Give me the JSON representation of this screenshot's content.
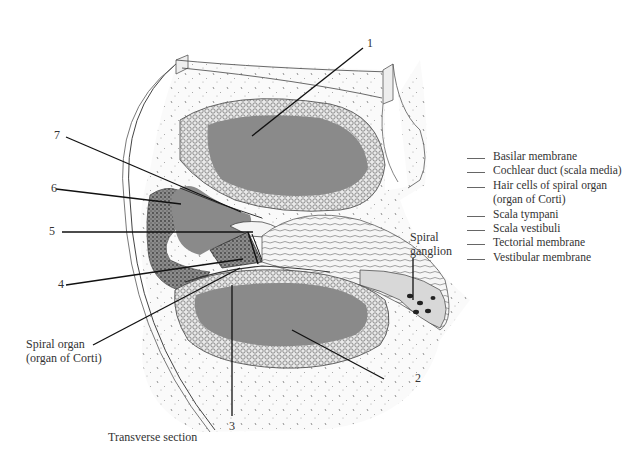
{
  "figure": {
    "caption": "Transverse section",
    "colors": {
      "fluid_gray": "#8a8a8a",
      "bone_stipple": "#f3f3f3",
      "tissue_dark": "#6a6a6a",
      "line": "#111111"
    },
    "numbered_labels": [
      {
        "id": "1",
        "text": "1"
      },
      {
        "id": "2",
        "text": "2"
      },
      {
        "id": "3",
        "text": "3"
      },
      {
        "id": "4",
        "text": "4"
      },
      {
        "id": "5",
        "text": "5"
      },
      {
        "id": "6",
        "text": "6"
      },
      {
        "id": "7",
        "text": "7"
      }
    ],
    "named_labels": {
      "spiral_organ_line1": "Spiral organ",
      "spiral_organ_line2": "(organ of Corti)",
      "spiral_ganglion_line1": "Spiral",
      "spiral_ganglion_line2": "ganglion"
    }
  },
  "legend": {
    "items": [
      {
        "text": "Basilar membrane"
      },
      {
        "text": "Cochlear duct (scala media)"
      },
      {
        "text": "Hair cells of spiral organ"
      },
      {
        "text": "(organ of Corti)",
        "continuation": true
      },
      {
        "text": "Scala tympani"
      },
      {
        "text": "Scala vestibuli"
      },
      {
        "text": "Tectorial membrane"
      },
      {
        "text": "Vestibular membrane"
      }
    ]
  }
}
